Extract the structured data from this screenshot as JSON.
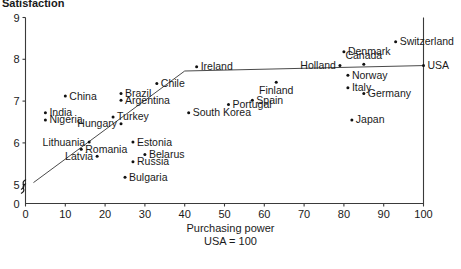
{
  "chart_data": {
    "type": "scatter",
    "title": "Satisfaction",
    "xlabel": "Purchasing power",
    "xlabel_sub": "USA = 100",
    "ylabel": "Satisfaction",
    "xlim": [
      0,
      100
    ],
    "ylim": [
      4.55,
      9
    ],
    "y_axis_break": true,
    "y_break_symbol": "≈",
    "grid": false,
    "legend": "none",
    "xticks": [
      0,
      10,
      20,
      30,
      40,
      50,
      60,
      70,
      80,
      90,
      100
    ],
    "yticks": [
      0,
      5,
      6,
      7,
      8,
      9
    ],
    "xtick_labels": [
      "0",
      "10",
      "20",
      "30",
      "40",
      "50",
      "60",
      "70",
      "80",
      "90",
      "100"
    ],
    "ytick_labels": [
      "0",
      "5",
      "6",
      "7",
      "8",
      "9"
    ],
    "trendline": {
      "x0": 2,
      "y0": 5.05,
      "x1": 40,
      "y1": 7.72,
      "x2": 100,
      "y2": 7.85
    },
    "points": [
      {
        "name": "India",
        "x": 5,
        "y": 6.72,
        "label_side": "right"
      },
      {
        "name": "Nigeria",
        "x": 5,
        "y": 6.55,
        "label_side": "right"
      },
      {
        "name": "China",
        "x": 10,
        "y": 7.12,
        "label_side": "right"
      },
      {
        "name": "Lithuania",
        "x": 16,
        "y": 6.02,
        "label_side": "left"
      },
      {
        "name": "Latvia",
        "x": 18,
        "y": 5.68,
        "label_side": "left"
      },
      {
        "name": "Romania",
        "x": 14,
        "y": 5.85,
        "label_side": "right"
      },
      {
        "name": "Bulgaria",
        "x": 25,
        "y": 5.18,
        "label_side": "right"
      },
      {
        "name": "Russia",
        "x": 27,
        "y": 5.55,
        "label_side": "right"
      },
      {
        "name": "Belarus",
        "x": 30,
        "y": 5.72,
        "label_side": "right"
      },
      {
        "name": "Estonia",
        "x": 27,
        "y": 6.02,
        "label_side": "right"
      },
      {
        "name": "Hungary",
        "x": 24,
        "y": 6.46,
        "label_side": "left"
      },
      {
        "name": "Turkey",
        "x": 22,
        "y": 6.62,
        "label_side": "right"
      },
      {
        "name": "Brazil",
        "x": 24,
        "y": 7.18,
        "label_side": "right"
      },
      {
        "name": "Argentina",
        "x": 24,
        "y": 7.02,
        "label_side": "right"
      },
      {
        "name": "Chile",
        "x": 33,
        "y": 7.42,
        "label_side": "right"
      },
      {
        "name": "South Korea",
        "x": 41,
        "y": 6.72,
        "label_side": "right"
      },
      {
        "name": "Ireland",
        "x": 43,
        "y": 7.82,
        "label_side": "right"
      },
      {
        "name": "Portugal",
        "x": 51,
        "y": 6.92,
        "label_side": "right"
      },
      {
        "name": "Spain",
        "x": 57,
        "y": 7.02,
        "label_side": "right"
      },
      {
        "name": "Finland",
        "x": 63,
        "y": 7.45,
        "label_side": "below"
      },
      {
        "name": "Holland",
        "x": 79,
        "y": 7.85,
        "label_side": "left"
      },
      {
        "name": "Denmark",
        "x": 80,
        "y": 8.18,
        "label_side": "right"
      },
      {
        "name": "Canada",
        "x": 85,
        "y": 7.88,
        "label_side": "above"
      },
      {
        "name": "Norway",
        "x": 81,
        "y": 7.62,
        "label_side": "right"
      },
      {
        "name": "Italy",
        "x": 81,
        "y": 7.32,
        "label_side": "right"
      },
      {
        "name": "Germany",
        "x": 85,
        "y": 7.18,
        "label_side": "right"
      },
      {
        "name": "Japan",
        "x": 82,
        "y": 6.55,
        "label_side": "right"
      },
      {
        "name": "Switzerland",
        "x": 93,
        "y": 8.42,
        "label_side": "right"
      },
      {
        "name": "USA",
        "x": 100,
        "y": 7.85,
        "label_side": "right"
      }
    ]
  }
}
